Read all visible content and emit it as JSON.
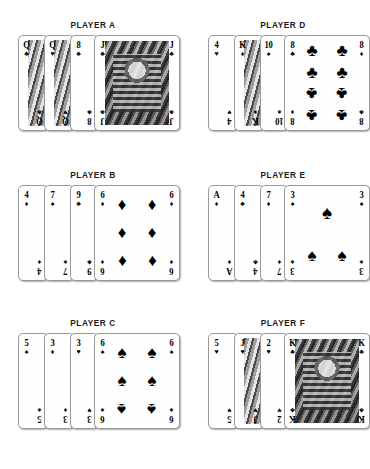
{
  "suits": {
    "spade": "♠",
    "heart": "♥",
    "diamond": "♦",
    "club": "♣"
  },
  "hands": [
    {
      "title": "PLAYER A",
      "cards": [
        {
          "rank": "Q",
          "suit": "♣",
          "kind": "court"
        },
        {
          "rank": "Q",
          "suit": "♥",
          "kind": "court"
        },
        {
          "rank": "8",
          "suit": "♣",
          "kind": "pip"
        },
        {
          "rank": "J",
          "suit": "♣",
          "kind": "court"
        },
        {
          "rank": "J",
          "suit": "♣",
          "kind": "court"
        }
      ]
    },
    {
      "title": "PLAYER D",
      "cards": [
        {
          "rank": "4",
          "suit": "♥",
          "kind": "pip"
        },
        {
          "rank": "K",
          "suit": "♦",
          "kind": "court"
        },
        {
          "rank": "10",
          "suit": "♠",
          "kind": "pip"
        },
        {
          "rank": "8",
          "suit": "♣",
          "kind": "pip"
        },
        {
          "rank": "8",
          "suit": "♦",
          "kind": "pip"
        }
      ]
    },
    {
      "title": "PLAYER B",
      "cards": [
        {
          "rank": "4",
          "suit": "♦",
          "kind": "pip"
        },
        {
          "rank": "7",
          "suit": "♠",
          "kind": "pip"
        },
        {
          "rank": "9",
          "suit": "♣",
          "kind": "pip"
        },
        {
          "rank": "6",
          "suit": "♦",
          "kind": "pip"
        },
        {
          "rank": "6",
          "suit": "♦",
          "kind": "pip"
        }
      ]
    },
    {
      "title": "PLAYER E",
      "cards": [
        {
          "rank": "A",
          "suit": "♦",
          "kind": "pip"
        },
        {
          "rank": "4",
          "suit": "♣",
          "kind": "pip"
        },
        {
          "rank": "7",
          "suit": "♦",
          "kind": "pip"
        },
        {
          "rank": "3",
          "suit": "♠",
          "kind": "pip"
        },
        {
          "rank": "3",
          "suit": "♠",
          "kind": "pip"
        }
      ]
    },
    {
      "title": "PLAYER C",
      "cards": [
        {
          "rank": "5",
          "suit": "♠",
          "kind": "pip"
        },
        {
          "rank": "3",
          "suit": "♦",
          "kind": "pip"
        },
        {
          "rank": "3",
          "suit": "♥",
          "kind": "pip"
        },
        {
          "rank": "6",
          "suit": "♠",
          "kind": "pip"
        },
        {
          "rank": "6",
          "suit": "♠",
          "kind": "pip"
        }
      ]
    },
    {
      "title": "PLAYER F",
      "cards": [
        {
          "rank": "5",
          "suit": "♥",
          "kind": "pip"
        },
        {
          "rank": "J",
          "suit": "♥",
          "kind": "court"
        },
        {
          "rank": "2",
          "suit": "♥",
          "kind": "pip"
        },
        {
          "rank": "K",
          "suit": "♣",
          "kind": "court"
        },
        {
          "rank": "K",
          "suit": "♣",
          "kind": "court"
        }
      ]
    }
  ],
  "layout": {
    "columns": [
      18,
      208
    ],
    "rows": [
      20,
      170,
      318
    ],
    "card_offsets": [
      0,
      26,
      52,
      76,
      76
    ],
    "card_widths": [
      30,
      30,
      28,
      86,
      86
    ]
  }
}
